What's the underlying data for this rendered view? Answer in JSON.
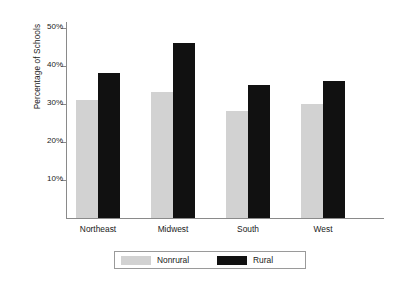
{
  "chart_data": {
    "type": "bar",
    "title": "",
    "subtitle": "",
    "xlabel": "",
    "ylabel": "Percentage of Schools",
    "categories": [
      "Northeast",
      "Midwest",
      "South",
      "West"
    ],
    "series": [
      {
        "name": "Nonrural",
        "color": "#d2d2d2",
        "values": [
          31,
          33,
          28,
          30
        ]
      },
      {
        "name": "Rural",
        "color": "#111111",
        "values": [
          38,
          46,
          35,
          36
        ]
      }
    ],
    "ylim": [
      0,
      52
    ],
    "ytick_values": [
      10,
      20,
      30,
      40,
      50
    ],
    "ytick_labels": [
      "10%",
      "20%",
      "30%",
      "40%",
      "50%"
    ],
    "grid": false,
    "legend_position": "bottom",
    "legend_entries": [
      {
        "label": "Nonrural",
        "color": "#d2d2d2"
      },
      {
        "label": "Rural",
        "color": "#111111"
      }
    ],
    "axis_color": "#8a8a8a",
    "background": "#ffffff"
  }
}
